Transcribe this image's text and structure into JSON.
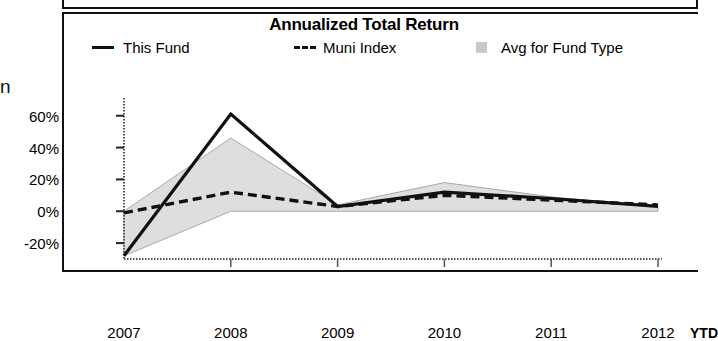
{
  "chart_data": {
    "type": "line",
    "title": "Annualized Total Return",
    "xlabel": "",
    "ylabel": "",
    "grid": false,
    "legend_position": "top",
    "categories": [
      "2007",
      "2008",
      "2009",
      "2010",
      "2011",
      "2012"
    ],
    "x_tick_labels": [
      "2007",
      "2008",
      "2009",
      "2010",
      "2011",
      "2012"
    ],
    "x_axis_suffix_label": "YTD",
    "y_tick_labels": [
      "60%",
      "40%",
      "20%",
      "0%",
      "-20%"
    ],
    "y_tick_values": [
      60,
      40,
      20,
      0,
      -20
    ],
    "ylim": [
      -30,
      68
    ],
    "series": [
      {
        "name": "This Fund",
        "style": "solid",
        "color": "#111111",
        "values": [
          -28,
          61,
          3,
          12,
          8,
          3
        ]
      },
      {
        "name": "Muni Index",
        "style": "dashed",
        "color": "#111111",
        "values": [
          -1,
          12,
          3,
          10,
          7,
          4
        ]
      },
      {
        "name": "Avg for Fund Type",
        "style": "area",
        "color": "#c9c9c9",
        "upper_values": [
          0,
          46,
          4,
          18,
          9,
          3
        ],
        "lower_values": [
          -28,
          0,
          0,
          0,
          0,
          0
        ]
      }
    ]
  },
  "legend": {
    "this_fund": "This Fund",
    "muni_index": "Muni Index",
    "avg_for_fund_type": "Avg for Fund Type"
  },
  "left_clipped_text": "n"
}
